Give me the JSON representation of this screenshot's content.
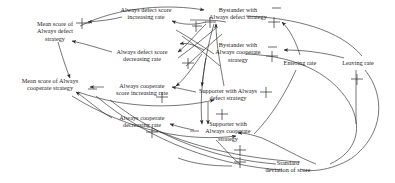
{
  "diagram": {
    "type": "causal-loop-diagram",
    "title": "",
    "background_color": "#ffffff",
    "line_color": "#2b2b2b",
    "text_color": "#1a1a1a",
    "nodes": [
      {
        "id": "mean-defect",
        "label": "Mean score of\nAlways defect\nstrategy",
        "x": 55,
        "y": 31
      },
      {
        "id": "defect-inc",
        "label": "Always defect score\nincreasing rate",
        "x": 146,
        "y": 13
      },
      {
        "id": "defect-dec",
        "label": "Always defect score\ndecreasing rate",
        "x": 142,
        "y": 55
      },
      {
        "id": "mean-cooperate",
        "label": "Mean score of Always\ncooperate strategy",
        "x": 50,
        "y": 84
      },
      {
        "id": "cooperate-inc",
        "label": "Always cooperate\nscore increasing rate",
        "x": 142,
        "y": 89
      },
      {
        "id": "cooperate-dec",
        "label": "Always cooperate\ndecreasing rate",
        "x": 142,
        "y": 121
      },
      {
        "id": "bystander-defect",
        "label": "Bystander with\nAlways defect strategy",
        "x": 238,
        "y": 13
      },
      {
        "id": "bystander-coop",
        "label": "Bystander with\nAlways cooperate\nstrategy",
        "x": 238,
        "y": 52
      },
      {
        "id": "entering-rate",
        "label": "Entering rate",
        "x": 300,
        "y": 63
      },
      {
        "id": "leaving-rate",
        "label": "Leaving rate",
        "x": 358,
        "y": 63
      },
      {
        "id": "supporter-defect",
        "label": "Supporter with Always\ndefect strategy",
        "x": 228,
        "y": 94
      },
      {
        "id": "supporter-coop",
        "label": "Supporter with\nAlways cooperate\nstrategy",
        "x": 228,
        "y": 131
      },
      {
        "id": "std-deviation",
        "label": "Standard\ndeviation of score",
        "x": 288,
        "y": 166
      }
    ],
    "polarity_marks": [
      {
        "id": "mark-1",
        "type": "plus-valve",
        "x": 82,
        "y": 23
      },
      {
        "id": "mark-2",
        "type": "plus-valve",
        "x": 196,
        "y": 26
      },
      {
        "id": "mark-3",
        "type": "plus-valve",
        "x": 210,
        "y": 22
      },
      {
        "id": "mark-4",
        "type": "plus-valve",
        "x": 188,
        "y": 63
      },
      {
        "id": "mark-5",
        "type": "plus-valve",
        "x": 162,
        "y": 97
      },
      {
        "id": "mark-6",
        "type": "plus-valve",
        "x": 274,
        "y": 22
      },
      {
        "id": "mark-7",
        "type": "plus-valve",
        "x": 272,
        "y": 56
      },
      {
        "id": "mark-8",
        "type": "plus-valve",
        "x": 152,
        "y": 132
      },
      {
        "id": "mark-9",
        "type": "plus-valve",
        "x": 266,
        "y": 92
      },
      {
        "id": "mark-10",
        "type": "plus-valve",
        "x": 222,
        "y": 114
      },
      {
        "id": "mark-11",
        "type": "plus-valve",
        "x": 357,
        "y": 79
      },
      {
        "id": "mark-12",
        "type": "plus-valve",
        "x": 240,
        "y": 152
      },
      {
        "id": "mark-13",
        "type": "plus-valve",
        "x": 240,
        "y": 163
      },
      {
        "id": "mark-14",
        "type": "minus-dash",
        "x": 276,
        "y": 8
      },
      {
        "id": "mark-15",
        "type": "minus-dash",
        "x": 272,
        "y": 47
      },
      {
        "id": "mark-16",
        "type": "minus-dash",
        "x": 92,
        "y": 89
      },
      {
        "id": "mark-17",
        "type": "minus-dash",
        "x": 194,
        "y": 131
      }
    ],
    "edges": [
      {
        "id": "e1",
        "from": "defect-inc",
        "to": "mean-defect"
      },
      {
        "id": "e2",
        "from": "defect-dec",
        "to": "mean-defect"
      },
      {
        "id": "e3",
        "from": "cooperate-inc",
        "to": "mean-cooperate"
      },
      {
        "id": "e4",
        "from": "cooperate-dec",
        "to": "mean-cooperate"
      },
      {
        "id": "e5",
        "from": "bystander-defect",
        "to": "defect-inc"
      },
      {
        "id": "e6",
        "from": "bystander-coop",
        "to": "cooperate-inc"
      },
      {
        "id": "e7",
        "from": "supporter-defect",
        "to": "supporter-coop"
      },
      {
        "id": "e8",
        "from": "entering-rate",
        "to": "bystander-defect"
      },
      {
        "id": "e9",
        "from": "leaving-rate",
        "to": "bystander-coop"
      },
      {
        "id": "e10",
        "from": "std-deviation",
        "to": "supporter-coop"
      },
      {
        "id": "e11",
        "from": "mean-defect",
        "to": "mean-cooperate"
      },
      {
        "id": "e12",
        "from": "supporter-defect",
        "to": "defect-dec"
      },
      {
        "id": "e13",
        "from": "supporter-coop",
        "to": "cooperate-dec"
      },
      {
        "id": "e14",
        "from": "leaving-rate",
        "to": "std-deviation"
      }
    ]
  }
}
